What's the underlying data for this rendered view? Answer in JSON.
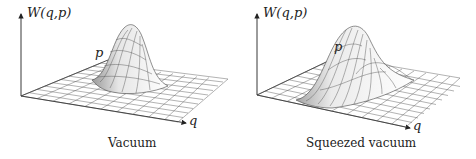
{
  "figure": {
    "panels": [
      {
        "caption": "Vacuum",
        "z_label": "W(q,p)",
        "p_label": "p",
        "q_label": "q",
        "surface": "symmetric Gaussian"
      },
      {
        "caption": "Squeezed vacuum",
        "z_label": "W(q,p)",
        "p_label": "p",
        "q_label": "q",
        "surface": "squeezed (elongated) Gaussian"
      }
    ],
    "colors": {
      "lines": "#333333",
      "surface": "#f2f2f2",
      "shade": "#bdbdbd"
    }
  }
}
